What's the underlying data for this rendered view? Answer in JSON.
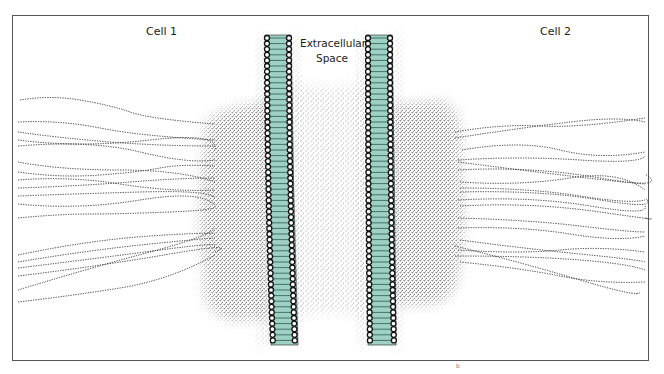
{
  "diagram": {
    "labels": {
      "cell_1": "Cell 1",
      "cell_2": "Cell 2",
      "extracellular_line1": "Extracellular",
      "extracellular_line2": "Space",
      "corner_mark": "b"
    },
    "colors": {
      "membrane_fill": "#9fd0c4",
      "lipid_head": "#ffffff",
      "outline": "#111111",
      "stipple": "#222222",
      "frame": "#555555"
    },
    "structures": [
      "cell-1-cytoplasm",
      "cell-1-membrane",
      "extracellular-space",
      "cell-2-membrane",
      "cell-2-cytoplasm",
      "intermediate-filaments"
    ]
  }
}
